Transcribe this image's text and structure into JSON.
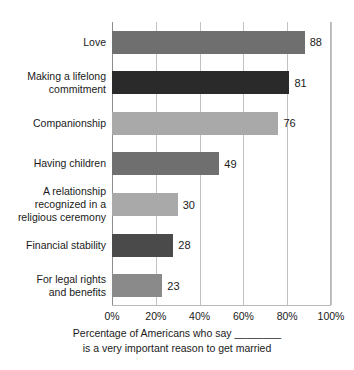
{
  "chart_data": {
    "type": "bar",
    "orientation": "horizontal",
    "title": "",
    "subtitle": "",
    "xlabel_line1": "Percentage of Americans who say ________",
    "xlabel_line2": "is a very important reason to get married",
    "ylabel": "",
    "xlim": [
      0,
      100
    ],
    "xticks": [
      0,
      20,
      40,
      60,
      80,
      100
    ],
    "xtick_labels": [
      "0%",
      "20%",
      "40%",
      "60%",
      "80%",
      "100%"
    ],
    "grid": true,
    "grid_axis": "x",
    "legend": false,
    "categories": [
      "Love",
      "Making a lifelong commitment",
      "Companionship",
      "Having children",
      "A relationship recognized in a religious ceremony",
      "Financial stability",
      "For legal rights and benefits"
    ],
    "values": [
      88,
      81,
      76,
      49,
      30,
      28,
      23
    ],
    "value_labels": [
      "88",
      "81",
      "76",
      "49",
      "30",
      "28",
      "23"
    ],
    "bar_colors": [
      "#6f6f6f",
      "#2a2a2a",
      "#a9a9a9",
      "#6f6f6f",
      "#a9a9a9",
      "#4a4a4a",
      "#8a8a8a"
    ],
    "category_label_lines": [
      [
        "Love"
      ],
      [
        "Making a lifelong",
        "commitment"
      ],
      [
        "Companionship"
      ],
      [
        "Having children"
      ],
      [
        "A relationship",
        "recognized in a",
        "religious ceremony"
      ],
      [
        "Financial stability"
      ],
      [
        "For legal rights",
        "and benefits"
      ]
    ]
  },
  "colors": {
    "background": "#ffffff",
    "gridline": "#c2c2c2",
    "axis": "#8d8d8d",
    "frame": "#b9b9b9",
    "text": "#1a1a1a"
  }
}
